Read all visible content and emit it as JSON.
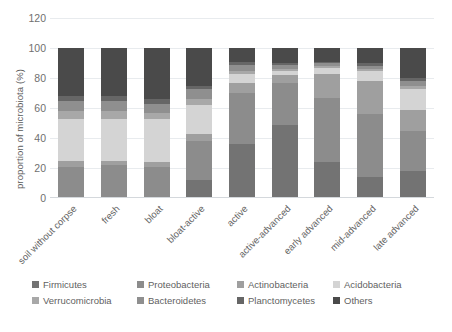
{
  "chart_data": {
    "type": "bar",
    "subtype": "stacked-bar-100-percent",
    "title": "",
    "xlabel": "",
    "ylabel": "proportion of microbiota (%)",
    "ylim": [
      0,
      120
    ],
    "yticks": [
      0,
      20,
      40,
      60,
      80,
      100,
      120
    ],
    "ytick_labels": [
      "0",
      "20",
      "40",
      "60",
      "80",
      "100",
      "120"
    ],
    "grid": true,
    "grid_axis": "y",
    "legend_position": "bottom",
    "categories": [
      "soil without corpse",
      "fresh",
      "bloat",
      "bloat-active",
      "active",
      "active-advanced",
      "early advanced",
      "mid-advanced",
      "late advanced"
    ],
    "series": [
      {
        "name": "Firmicutes",
        "color": "#737373",
        "values": [
          1,
          1,
          1,
          12,
          36,
          49,
          24,
          14,
          18
        ]
      },
      {
        "name": "Proteobacteria",
        "color": "#8c8c8c",
        "values": [
          20,
          21,
          20,
          26,
          34,
          28,
          43,
          42,
          27
        ]
      },
      {
        "name": "Actinobacteria",
        "color": "#9f9f9f",
        "values": [
          4,
          3,
          3,
          5,
          7,
          5,
          16,
          22,
          14
        ]
      },
      {
        "name": "Acidobacteria",
        "color": "#d4d4d4",
        "values": [
          28,
          28,
          29,
          19,
          6,
          3,
          4,
          7,
          14
        ]
      },
      {
        "name": "Verrucomicrobia",
        "color": "#a8a8a8",
        "values": [
          5,
          5,
          4,
          4,
          2,
          1,
          1,
          1,
          2
        ]
      },
      {
        "name": "Bacteroidetes",
        "color": "#8f8f8f",
        "values": [
          7,
          7,
          6,
          7,
          4,
          3,
          2,
          2,
          3
        ]
      },
      {
        "name": "Planctomycetes",
        "color": "#666666",
        "values": [
          3,
          3,
          3,
          2,
          2,
          1,
          1,
          2,
          2
        ]
      },
      {
        "name": "Others",
        "color": "#4a4a4a",
        "values": [
          32,
          32,
          34,
          25,
          9,
          10,
          9,
          10,
          20
        ]
      }
    ]
  },
  "legend": {
    "rows": [
      [
        {
          "label": "Firmicutes",
          "color": "#737373",
          "width": 105
        },
        {
          "label": "Proteobacteria",
          "color": "#8c8c8c",
          "width": 100
        },
        {
          "label": "Actinobacteria",
          "color": "#9f9f9f",
          "width": 96
        },
        {
          "label": "Acidobacteria",
          "color": "#d4d4d4",
          "width": 91
        }
      ],
      [
        {
          "label": "Verrucomicrobia",
          "color": "#a8a8a8",
          "width": 105
        },
        {
          "label": "Bacteroidetes",
          "color": "#8f8f8f",
          "width": 100
        },
        {
          "label": "Planctomycetes",
          "color": "#666666",
          "width": 96
        },
        {
          "label": "Others",
          "color": "#4a4a4a",
          "width": 91
        }
      ]
    ]
  },
  "caption": ""
}
